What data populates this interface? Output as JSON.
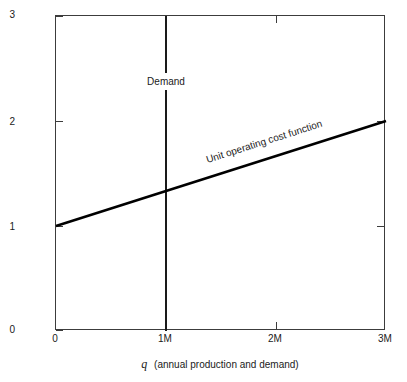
{
  "chart_data": {
    "type": "line",
    "title": "",
    "subtitle": "",
    "xlabel_var": "q",
    "xlabel_text": "(annual production and demand)",
    "ylabel_var": "p",
    "ylabel_text": "($ per unit)",
    "xlim": [
      0,
      3
    ],
    "ylim": [
      0,
      3
    ],
    "grid": false,
    "legend": "none",
    "x_unit": "M",
    "x_ticks": [
      {
        "value": 0,
        "label": "0"
      },
      {
        "value": 1,
        "label": "1M"
      },
      {
        "value": 2,
        "label": "2M"
      },
      {
        "value": 3,
        "label": "3M"
      }
    ],
    "y_ticks": [
      {
        "value": 0,
        "label": "0"
      },
      {
        "value": 1,
        "label": "1"
      },
      {
        "value": 2,
        "label": "2"
      },
      {
        "value": 3,
        "label": "3"
      }
    ],
    "series": [
      {
        "name": "Unit operating cost function",
        "kind": "line",
        "x": [
          0,
          3
        ],
        "y": [
          1,
          2
        ],
        "intercept": 1,
        "slope_per_million": 0.3333,
        "annotation": "Unit operating cost function"
      },
      {
        "name": "Demand",
        "kind": "vertical-line",
        "x": [
          1,
          1
        ],
        "y": [
          0,
          3
        ],
        "annotation": "Demand"
      }
    ],
    "annotations": [
      {
        "text": "Demand",
        "x": 1,
        "y": 2.45
      },
      {
        "text": "Unit operating cost function",
        "x": 1.85,
        "y": 1.6
      }
    ],
    "colors": {
      "background": "#ffffff",
      "axis": "#3c3c3c",
      "series_line": "#000000",
      "demand_line": "#1a1a1a",
      "text": "#1a1a1a"
    }
  }
}
